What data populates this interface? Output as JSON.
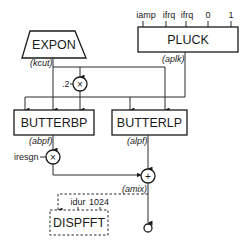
{
  "diagram": {
    "units": {
      "expon": {
        "label": "EXPON",
        "output": "(kcut)"
      },
      "pluck": {
        "label": "PLUCK",
        "inputs": [
          "iamp",
          "ifrq",
          "ifrq",
          "0",
          "1"
        ],
        "output": "(aplk)"
      },
      "butterbp": {
        "label": "BUTTERBP",
        "output": "(abpf)"
      },
      "butterlp": {
        "label": "BUTTERLP",
        "output": "(alpf)"
      },
      "dispfft": {
        "label": "DISPFFT",
        "inputs": [
          "idur",
          "1024"
        ]
      }
    },
    "operators": {
      "mult1": {
        "symbol": "×",
        "constant": ".2"
      },
      "mult2": {
        "symbol": "×",
        "constant": "iresgn"
      },
      "sum": {
        "symbol": "+",
        "output": "(amix)"
      }
    },
    "colors": {
      "stroke": "#1a1a1a",
      "background": "#ffffff"
    }
  }
}
